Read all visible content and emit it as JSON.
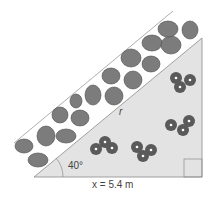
{
  "diagram": {
    "angle_label": "40°",
    "hypotenuse_label": "r",
    "base_label": "x = 5.4 m",
    "colors": {
      "triangle_fill": "#e3e3e3",
      "triangle_stroke": "#8a8a8a",
      "stone_fill": "#7c7c7c",
      "stone_stroke": "#4a4a4a",
      "flower_fill": "#5a5a5a",
      "flower_center": "#ffffff"
    }
  }
}
